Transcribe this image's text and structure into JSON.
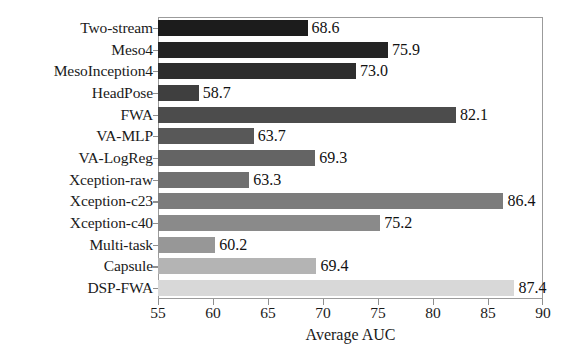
{
  "chart_data": {
    "type": "bar",
    "orientation": "horizontal",
    "title": "",
    "xlabel": "Average AUC",
    "ylabel": "",
    "xlim": [
      55,
      90
    ],
    "xticks": [
      55,
      60,
      65,
      70,
      75,
      80,
      85,
      90
    ],
    "grid": false,
    "legend": false,
    "categories": [
      "Two-stream",
      "Meso4",
      "MesoInception4",
      "HeadPose",
      "FWA",
      "VA-MLP",
      "VA-LogReg",
      "Xception-raw",
      "Xception-c23",
      "Xception-c40",
      "Multi-task",
      "Capsule",
      "DSP-FWA"
    ],
    "values": [
      68.6,
      75.9,
      73.0,
      58.7,
      82.1,
      63.7,
      69.3,
      63.3,
      86.4,
      75.2,
      60.2,
      69.4,
      87.4
    ],
    "value_labels": [
      "68.6",
      "75.9",
      "73.0",
      "58.7",
      "82.1",
      "63.7",
      "69.3",
      "63.3",
      "86.4",
      "75.2",
      "60.2",
      "69.4",
      "87.4"
    ],
    "bar_colors": [
      "#1c1c1c",
      "#242424",
      "#2e2e2e",
      "#3f3f3f",
      "#4c4c4c",
      "#585858",
      "#646464",
      "#707070",
      "#7c7c7c",
      "#8a8a8a",
      "#979797",
      "#b4b4b4",
      "#d8d8d8"
    ],
    "xtick_labels": [
      "55",
      "60",
      "65",
      "70",
      "75",
      "80",
      "85",
      "90"
    ],
    "frame_color": "#9b9b9b",
    "background_color": "#ffffff",
    "text_color": "#1a1a1a"
  }
}
